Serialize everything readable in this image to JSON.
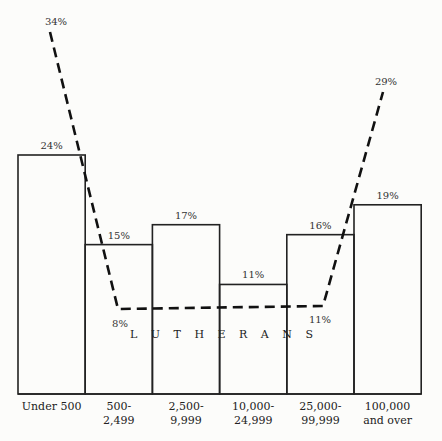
{
  "chart_data": {
    "type": "bar",
    "title": "",
    "xlabel": "",
    "ylabel": "",
    "categories": [
      "Under 500",
      "500-2,499",
      "2,500-9,999",
      "10,000-24,999",
      "25,000-99,999",
      "100,000 and over"
    ],
    "category_lines": [
      [
        "Under 500"
      ],
      [
        "500-",
        "2,499"
      ],
      [
        "2,500-",
        "9,999"
      ],
      [
        "10,000-",
        "24,999"
      ],
      [
        "25,000-",
        "99,999"
      ],
      [
        "100,000",
        "and over"
      ]
    ],
    "series": [
      {
        "name": "All (bars)",
        "style": "bar",
        "values": [
          24,
          15,
          17,
          11,
          16,
          19
        ],
        "labels": [
          "24%",
          "15%",
          "17%",
          "11%",
          "16%",
          "19%"
        ]
      },
      {
        "name": "LUTHERANS",
        "style": "dashed-line",
        "points": [
          {
            "category": "Under 500",
            "value": 34,
            "label": "34%"
          },
          {
            "category": "500-2,499",
            "value": 8,
            "label": "8%"
          },
          {
            "category": "25,000-99,999",
            "value": 11,
            "label": "11%"
          },
          {
            "category": "100,000 and over",
            "value": 29,
            "label": "29%"
          }
        ]
      }
    ],
    "annotation": "L U T H E R A N S",
    "grid": false,
    "legend": "none"
  }
}
